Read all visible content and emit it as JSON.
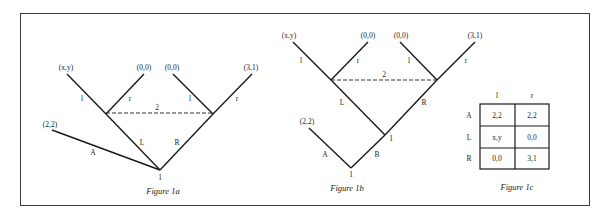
{
  "figures": {
    "fig1a": {
      "caption": "Figure 1a",
      "root_label": "1",
      "info_set_label": "2",
      "payoffs": {
        "a": "(2,2)",
        "ll": "(x,y)",
        "lr": "(0,0)",
        "rl": "(0,0)",
        "rr": "(3,1)"
      },
      "edges": {
        "A": "A",
        "L": "L",
        "R": "R",
        "left_l": "l",
        "left_r": "r",
        "right_l": "l",
        "right_r": "r"
      }
    },
    "fig1b": {
      "caption": "Figure 1b",
      "root_label": "1",
      "mid_label": "1",
      "info_set_label": "2",
      "payoffs": {
        "a": "(2,2)",
        "ll": "(x,y)",
        "lr": "(0,0)",
        "rl": "(0,0)",
        "rr": "(3,1)"
      },
      "edges": {
        "A": "A",
        "B": "B",
        "L": "L",
        "R": "R",
        "left_l": "l",
        "left_r": "r",
        "right_l": "l",
        "right_r": "r"
      }
    },
    "fig1c": {
      "caption": "Figure 1c",
      "columns": [
        "l",
        "r"
      ],
      "rows": [
        {
          "label": "A",
          "cells": [
            "2,2",
            "2,2"
          ]
        },
        {
          "label": "L",
          "cells": [
            "x,y",
            "0,0"
          ]
        },
        {
          "label": "R",
          "cells": [
            "0,0",
            "3,1"
          ]
        }
      ]
    }
  }
}
